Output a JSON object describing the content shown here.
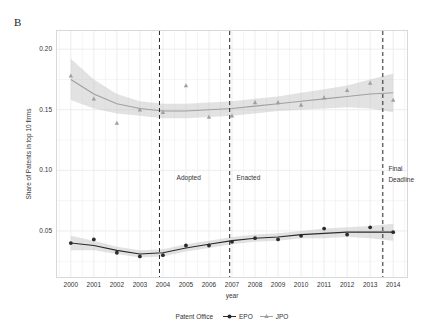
{
  "panel": {
    "label": "B"
  },
  "axes": {
    "ylabel": "Share of Patents in top 10 firms",
    "xlabel": "year",
    "yticks": [
      "0.05",
      "0.10",
      "0.15",
      "0.20"
    ],
    "ytick_values": [
      0.05,
      0.1,
      0.15,
      0.2
    ],
    "xticks": [
      "2000",
      "2001",
      "2002",
      "2003",
      "2004",
      "2005",
      "2006",
      "2007",
      "2008",
      "2009",
      "2010",
      "2011",
      "2012",
      "2013",
      "2014"
    ],
    "xlim": [
      1999.4,
      2014.6
    ],
    "ylim": [
      0.012,
      0.215
    ]
  },
  "legend": {
    "title": "Patent Office",
    "items": [
      {
        "label": "EPO",
        "color": "#2b2b2b",
        "marker": "filled-circle"
      },
      {
        "label": "JPO",
        "color": "#a0a0a0",
        "marker": "filled-triangle"
      }
    ]
  },
  "annotations": [
    {
      "name": "adopted",
      "text": "Adopted",
      "x": 2004.55,
      "y": 0.093
    },
    {
      "name": "enacted",
      "text": "Enacted",
      "x": 2007.15,
      "y": 0.093
    },
    {
      "name": "final-deadline-line1",
      "text": "Final",
      "x": 2013.75,
      "y": 0.1
    },
    {
      "name": "final-deadline-line2",
      "text": "Deadline",
      "x": 2013.75,
      "y": 0.091
    }
  ],
  "vlines": [
    2003.85,
    2006.9,
    2013.55
  ],
  "chart_data": {
    "type": "scatter",
    "title": "",
    "subtitle": "",
    "xlabel": "year",
    "ylabel": "Share of Patents in top 10 firms",
    "xlim": [
      1999.4,
      2014.6
    ],
    "ylim": [
      0.012,
      0.215
    ],
    "grid": true,
    "legend_position": "bottom",
    "x": [
      2000,
      2001,
      2002,
      2003,
      2004,
      2005,
      2006,
      2007,
      2008,
      2009,
      2010,
      2011,
      2012,
      2013,
      2014
    ],
    "series": [
      {
        "name": "JPO",
        "color": "#a0a0a0",
        "marker": "triangle",
        "values": [
          0.178,
          0.159,
          0.139,
          0.15,
          0.148,
          0.17,
          0.144,
          0.145,
          0.156,
          0.156,
          0.154,
          0.16,
          0.166,
          0.172,
          0.158
        ],
        "smooth": [
          0.175,
          0.163,
          0.155,
          0.151,
          0.149,
          0.149,
          0.15,
          0.151,
          0.153,
          0.155,
          0.157,
          0.159,
          0.161,
          0.163,
          0.164
        ],
        "ribbon_upper": [
          0.192,
          0.175,
          0.163,
          0.157,
          0.155,
          0.155,
          0.156,
          0.157,
          0.159,
          0.161,
          0.164,
          0.167,
          0.17,
          0.175,
          0.18
        ],
        "ribbon_lower": [
          0.158,
          0.151,
          0.147,
          0.145,
          0.143,
          0.143,
          0.144,
          0.145,
          0.147,
          0.149,
          0.15,
          0.151,
          0.152,
          0.151,
          0.148
        ]
      },
      {
        "name": "EPO",
        "color": "#2b2b2b",
        "marker": "circle",
        "values": [
          0.04,
          0.043,
          0.032,
          0.029,
          0.03,
          0.038,
          0.038,
          0.041,
          0.044,
          0.043,
          0.046,
          0.052,
          0.047,
          0.053,
          0.049
        ],
        "smooth": [
          0.04,
          0.038,
          0.034,
          0.031,
          0.032,
          0.036,
          0.039,
          0.042,
          0.044,
          0.045,
          0.047,
          0.048,
          0.049,
          0.049,
          0.049
        ],
        "ribbon_upper": [
          0.046,
          0.042,
          0.037,
          0.034,
          0.035,
          0.039,
          0.042,
          0.045,
          0.047,
          0.048,
          0.05,
          0.052,
          0.053,
          0.054,
          0.056
        ],
        "ribbon_lower": [
          0.034,
          0.034,
          0.031,
          0.028,
          0.029,
          0.033,
          0.036,
          0.039,
          0.041,
          0.042,
          0.044,
          0.044,
          0.045,
          0.044,
          0.042
        ]
      }
    ]
  }
}
